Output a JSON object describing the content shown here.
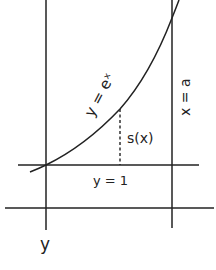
{
  "diagram": {
    "curve_label": "y = eˣ",
    "curve_label_plain": "y = e x",
    "vertical_line_label": "x = a",
    "horizontal_line_label": "y = 1",
    "segment_label": "s(x)",
    "axis_label": "y",
    "colors": {
      "ink": "#222222",
      "background": "#ffffff"
    }
  }
}
